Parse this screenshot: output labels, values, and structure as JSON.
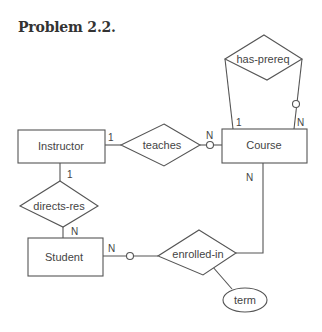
{
  "title": "Problem 2.2.",
  "entities": {
    "instructor": "Instructor",
    "course": "Course",
    "student": "Student"
  },
  "relationships": {
    "teaches": "teaches",
    "has_prereq": "has-prereq",
    "directs_res": "directs-res",
    "enrolled_in": "enrolled-in"
  },
  "attributes": {
    "term": "term"
  },
  "cardinalities": {
    "instructor_teaches": "1",
    "teaches_course": "N",
    "prereq_left": "1",
    "prereq_right": "N",
    "instructor_directs": "1",
    "directs_student": "N",
    "student_enrolled": "N",
    "course_enrolled": "N"
  },
  "colors": {
    "stroke": "#555555",
    "text": "#444444",
    "title": "#333333"
  }
}
